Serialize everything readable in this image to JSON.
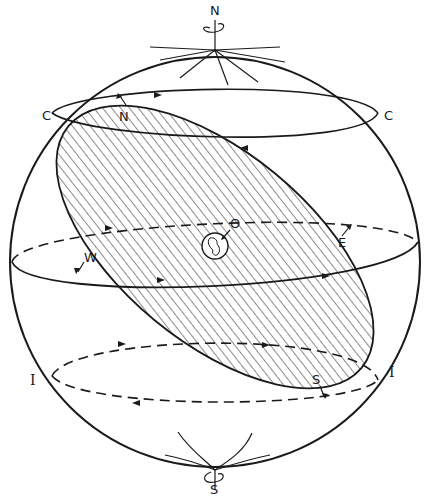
{
  "figure": {
    "colors": {
      "ink": "#1a1a1a",
      "background": "#ffffff"
    }
  },
  "labels": {
    "north_pole": "N",
    "south_pole": "S",
    "circle_left": "C",
    "circle_right": "C",
    "node_north": "N",
    "center": "O",
    "east": "E",
    "west": "W",
    "inclined_left": "I",
    "inclined_right": "I",
    "node_south": "S"
  }
}
